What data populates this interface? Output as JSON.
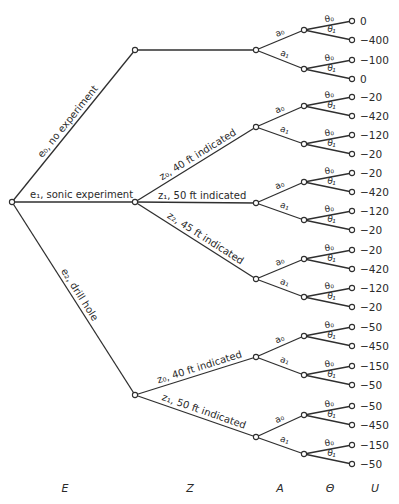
{
  "diagram": {
    "type": "decision-tree",
    "axis_labels": [
      "E",
      "Z",
      "A",
      "Θ",
      "U"
    ],
    "experiments": [
      {
        "id": "e0",
        "label": "e₀, no experiment",
        "outcomes": [
          {
            "id": "none",
            "label": "",
            "actions": [
              {
                "label": "a₀",
                "states": [
                  {
                    "label": "θ₀",
                    "utility": "0"
                  },
                  {
                    "label": "θ₁",
                    "utility": "−400"
                  }
                ]
              },
              {
                "label": "a₁",
                "states": [
                  {
                    "label": "θ₀",
                    "utility": "−100"
                  },
                  {
                    "label": "θ₁",
                    "utility": "0"
                  }
                ]
              }
            ]
          }
        ]
      },
      {
        "id": "e1",
        "label": "e₁, sonic experiment",
        "outcomes": [
          {
            "id": "z0",
            "label": "z₀, 40 ft indicated",
            "actions": [
              {
                "label": "a₀",
                "states": [
                  {
                    "label": "θ₀",
                    "utility": "−20"
                  },
                  {
                    "label": "θ₁",
                    "utility": "−420"
                  }
                ]
              },
              {
                "label": "a₁",
                "states": [
                  {
                    "label": "θ₀",
                    "utility": "−120"
                  },
                  {
                    "label": "θ₁",
                    "utility": "−20"
                  }
                ]
              }
            ]
          },
          {
            "id": "z1",
            "label": "z₁, 50 ft indicated",
            "actions": [
              {
                "label": "a₀",
                "states": [
                  {
                    "label": "θ₀",
                    "utility": "−20"
                  },
                  {
                    "label": "θ₁",
                    "utility": "−420"
                  }
                ]
              },
              {
                "label": "a₁",
                "states": [
                  {
                    "label": "θ₀",
                    "utility": "−120"
                  },
                  {
                    "label": "θ₁",
                    "utility": "−20"
                  }
                ]
              }
            ]
          },
          {
            "id": "z2",
            "label": "z₂, 45 ft indicated",
            "actions": [
              {
                "label": "a₀",
                "states": [
                  {
                    "label": "θ₀",
                    "utility": "−20"
                  },
                  {
                    "label": "θ₁",
                    "utility": "−420"
                  }
                ]
              },
              {
                "label": "a₁",
                "states": [
                  {
                    "label": "θ₀",
                    "utility": "−120"
                  },
                  {
                    "label": "θ₁",
                    "utility": "−20"
                  }
                ]
              }
            ]
          }
        ]
      },
      {
        "id": "e2",
        "label": "e₂, drill hole",
        "outcomes": [
          {
            "id": "z0",
            "label": "z₀, 40 ft indicated",
            "actions": [
              {
                "label": "a₀",
                "states": [
                  {
                    "label": "θ₀",
                    "utility": "−50"
                  },
                  {
                    "label": "θ₁",
                    "utility": "−450"
                  }
                ]
              },
              {
                "label": "a₁",
                "states": [
                  {
                    "label": "θ₀",
                    "utility": "−150"
                  },
                  {
                    "label": "θ₁",
                    "utility": "−50"
                  }
                ]
              }
            ]
          },
          {
            "id": "z1",
            "label": "z₁, 50 ft indicated",
            "actions": [
              {
                "label": "a₀",
                "states": [
                  {
                    "label": "θ₀",
                    "utility": "−50"
                  },
                  {
                    "label": "θ₁",
                    "utility": "−450"
                  }
                ]
              },
              {
                "label": "a₁",
                "states": [
                  {
                    "label": "θ₀",
                    "utility": "−150"
                  },
                  {
                    "label": "θ₁",
                    "utility": "−50"
                  }
                ]
              }
            ]
          }
        ]
      }
    ]
  }
}
